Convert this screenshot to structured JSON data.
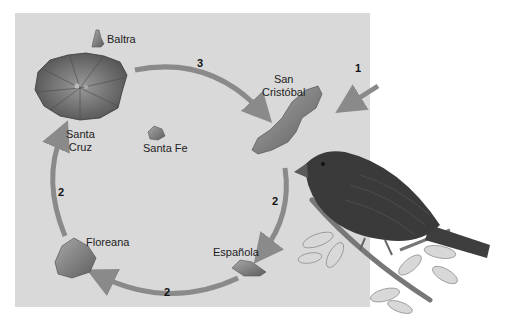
{
  "colors": {
    "panel": "#d9d9d9",
    "arrow": "#8a8a8a",
    "island": "#6e6e6e",
    "text": "#222222"
  },
  "islands": [
    {
      "name": "Baltra",
      "label": "Baltra"
    },
    {
      "name": "Santa Cruz",
      "label_line1": "Santa",
      "label_line2": "Cruz"
    },
    {
      "name": "Santa Fe",
      "label": "Santa Fe"
    },
    {
      "name": "San Cristóbal",
      "label_line1": "San",
      "label_line2": "Cristóbal"
    },
    {
      "name": "Floreana",
      "label": "Floreana"
    },
    {
      "name": "Española",
      "label": "Española"
    }
  ],
  "arrows": [
    {
      "id": "arrival",
      "label": "1",
      "from": "mainland",
      "to": "San Cristóbal"
    },
    {
      "id": "sc-to-esp",
      "label": "2",
      "from": "San Cristóbal",
      "to": "Española"
    },
    {
      "id": "esp-to-flo",
      "label": "2",
      "from": "Española",
      "to": "Floreana"
    },
    {
      "id": "flo-to-scz",
      "label": "2",
      "from": "Floreana",
      "to": "Santa Cruz"
    },
    {
      "id": "scz-to-sc",
      "label": "3",
      "from": "Santa Cruz",
      "to": "San Cristóbal"
    }
  ]
}
